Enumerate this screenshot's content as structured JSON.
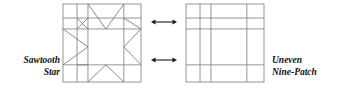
{
  "figure": {
    "background_color": "#ffffff",
    "line_color": "#8a8a8a",
    "diagonal_color": "#6f6f6f",
    "arrow_color": "#1a1a1a",
    "text_color": "#111111"
  },
  "labels": {
    "left": {
      "line1": "Sawtooth",
      "line2": "Star",
      "full": "Sawtooth Star",
      "align": "right"
    },
    "right": {
      "line1": "Uneven",
      "line2": "Nine-Patch",
      "full": "Uneven Nine-Patch",
      "align": "left"
    }
  },
  "blocks": {
    "sawtooth_star": {
      "name": "Sawtooth Star",
      "x": 63,
      "y": 4,
      "width": 78,
      "height": 78,
      "grid_fractions_x": [
        0,
        0.18,
        0.32,
        0.78,
        1
      ],
      "grid_fractions_y": [
        0,
        0.18,
        0.32,
        0.78,
        1
      ],
      "has_diagonals": true,
      "star_points": 8
    },
    "uneven_nine_patch": {
      "name": "Uneven Nine-Patch",
      "x": 186,
      "y": 4,
      "width": 78,
      "height": 78,
      "grid_fractions_x": [
        0,
        0.18,
        0.32,
        0.78,
        1
      ],
      "grid_fractions_y": [
        0,
        0.18,
        0.32,
        0.78,
        1
      ],
      "has_diagonals": false,
      "patches": 9
    }
  },
  "arrows": [
    {
      "name": "top-arrow",
      "x1": 151,
      "x2": 177,
      "y": 22,
      "double_headed": true
    },
    {
      "name": "bottom-arrow",
      "x1": 151,
      "x2": 177,
      "y": 60,
      "double_headed": true
    }
  ]
}
